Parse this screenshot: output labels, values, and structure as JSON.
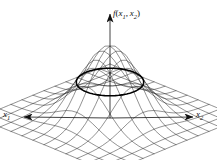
{
  "figure": {
    "kind": "3d-wireframe-surface-plot",
    "background_color": "#ffffff",
    "line_color": "#1a1a1a",
    "contour_color": "#000000"
  },
  "axes": {
    "vertical": {
      "name": "f-axis",
      "label_f": "f",
      "label_open": "(",
      "label_x": "x",
      "label_sub1": "1",
      "label_comma": ",",
      "label_x_b": "x",
      "label_sub2": "2",
      "label_close": ")",
      "arrow": "up-arrow-icon"
    },
    "left": {
      "name": "x1-axis",
      "label_x": "x",
      "label_sub": "1",
      "arrow": "left-arrow-icon"
    },
    "right": {
      "name": "x2-axis",
      "label_x": "x",
      "label_sub": "2",
      "arrow": "right-arrow-icon"
    }
  },
  "chart_data": {
    "type": "surface",
    "title": "",
    "xlabel": "x1",
    "ylabel": "x2",
    "zlabel": "f(x1, x2)",
    "function": "bivariate gaussian bell surface",
    "grid": true,
    "legend": false,
    "peak": {
      "x": 0,
      "y": 0,
      "z": 1
    },
    "xlim": [
      -3,
      3
    ],
    "ylim": [
      -3,
      3
    ],
    "zlim": [
      0,
      1
    ],
    "grid_lines_u": 13,
    "grid_lines_v": 13,
    "contour": {
      "type": "ellipse",
      "level": 0.5,
      "emphasized": true
    },
    "projection": {
      "origin_px": [
        110,
        118
      ],
      "u_axis_px": [
        -66,
        27
      ],
      "v_axis_px": [
        66,
        27
      ],
      "z_height_px": 72
    }
  }
}
